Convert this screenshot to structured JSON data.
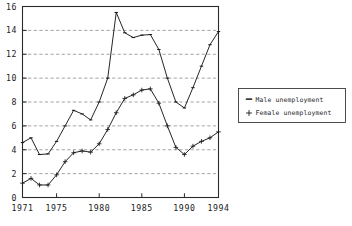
{
  "chart_data": {
    "type": "line",
    "title": "",
    "subtitle": "",
    "xlabel": "",
    "ylabel": "",
    "xlim": [
      1971,
      1994
    ],
    "ylim": [
      0,
      16
    ],
    "yticks": [
      0,
      2,
      4,
      6,
      8,
      10,
      12,
      14,
      16
    ],
    "xticks": [
      1971,
      1975,
      1980,
      1985,
      1990,
      1994
    ],
    "xtick_labels": [
      "1971",
      "1975",
      "1980",
      "1985",
      "1990",
      "1994"
    ],
    "ytick_labels": [
      "0",
      "2",
      "4",
      "6",
      "8",
      "10",
      "12",
      "14",
      "16"
    ],
    "grid": "horizontal-dashed",
    "legend_position": "right-outside",
    "x": [
      1971,
      1972,
      1973,
      1974,
      1975,
      1976,
      1977,
      1978,
      1979,
      1980,
      1981,
      1982,
      1983,
      1984,
      1985,
      1986,
      1987,
      1988,
      1989,
      1990,
      1991,
      1992,
      1993,
      1994
    ],
    "series": [
      {
        "name": "Male unemployment",
        "marker": "dash",
        "color": "#1a1a1a",
        "values": [
          4.6,
          5.0,
          3.6,
          3.65,
          4.7,
          6.0,
          7.3,
          7.0,
          6.5,
          8.0,
          10.0,
          15.5,
          13.8,
          13.4,
          13.6,
          13.65,
          12.4,
          10.0,
          8.0,
          7.5,
          9.2,
          11.0,
          12.8,
          13.9
        ]
      },
      {
        "name": "Female unemployment",
        "marker": "plus",
        "color": "#1a1a1a",
        "values": [
          1.2,
          1.6,
          1.05,
          1.05,
          1.9,
          3.0,
          3.75,
          3.9,
          3.8,
          4.5,
          5.7,
          7.1,
          8.3,
          8.6,
          9.0,
          9.1,
          7.9,
          6.0,
          4.2,
          3.6,
          4.3,
          4.7,
          5.0,
          5.5
        ]
      }
    ]
  },
  "legend": {
    "entries": [
      {
        "label": "Male unemployment",
        "marker_icon": "dash-marker-icon"
      },
      {
        "label": "Female unemployment",
        "marker_icon": "plus-marker-icon"
      }
    ]
  }
}
